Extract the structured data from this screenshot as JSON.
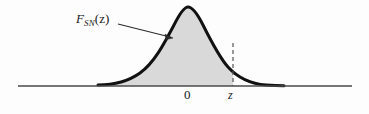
{
  "figure": {
    "kind": "statistics-distribution-diagram",
    "background_color": "#fdfdfd"
  },
  "curve": {
    "name": "normal-density-curve",
    "stroke_color": "#111111",
    "stroke_width": 3,
    "peak_x": 188,
    "peak_y": 8,
    "left_end_x": 98,
    "right_end_x": 284,
    "baseline_y": 86
  },
  "shaded_area": {
    "name": "cumulative-probability-region",
    "fill_color": "#d9d9d9",
    "from_x": 98,
    "to_x": 233,
    "label": "F_SN(z)"
  },
  "axis": {
    "name": "horizontal-axis",
    "color": "#4a4a4a",
    "y": 86,
    "x_start": 18,
    "x_end": 352,
    "ticks": [
      {
        "id": "zero",
        "label": "0",
        "x": 190,
        "italic": false
      },
      {
        "id": "z",
        "label": "z",
        "x": 233,
        "italic": true
      }
    ]
  },
  "dashed_line": {
    "name": "z-boundary-line",
    "x": 233,
    "y_top": 43,
    "y_bottom": 86,
    "color": "#555555",
    "dash_pattern": "4 3"
  },
  "annotation": {
    "name": "cdf-label-annotation",
    "label_prefix": "F",
    "label_subscript": "SN",
    "label_argument": "(z)",
    "full_text": "F_SN(z)",
    "arrow": {
      "from_x": 118,
      "from_y": 24,
      "to_x": 173,
      "to_y": 38,
      "color": "#2b2b2b"
    }
  }
}
